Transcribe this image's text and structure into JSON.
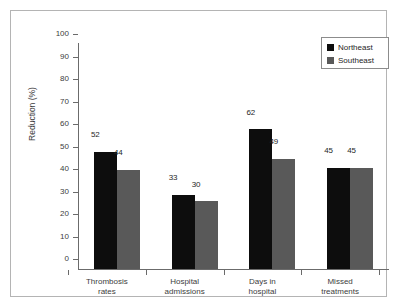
{
  "chart_data": {
    "type": "bar",
    "title": "",
    "xlabel": "",
    "ylabel": "Reduction (%)",
    "ylim": [
      0,
      100
    ],
    "ytick_step": 10,
    "yticks": [
      100,
      90,
      80,
      70,
      60,
      50,
      40,
      30,
      20,
      10,
      0
    ],
    "ytick_labels": [
      "100",
      "90",
      "80",
      "70",
      "60",
      "50",
      "40",
      "30",
      "20",
      "10",
      "0"
    ],
    "grid": false,
    "legend_position": "top-right",
    "categories": [
      "Thrombosis\nrates",
      "Hospital\nadmissions",
      "Days in\nhospital",
      "Missed\ntreatments"
    ],
    "series": [
      {
        "name": "Northeast",
        "color": "#0d0d0d",
        "values": [
          52,
          33,
          62,
          45
        ],
        "value_labels": [
          "52",
          "33",
          "62",
          "45"
        ]
      },
      {
        "name": "Southeast",
        "color": "#595959",
        "values": [
          44,
          30,
          49,
          45
        ],
        "value_labels": [
          "44",
          "30",
          "49",
          "45"
        ]
      }
    ]
  },
  "legend": {
    "entries": [
      {
        "label": "Northeast",
        "swatch": "legend-swatch-northeast"
      },
      {
        "label": "Southeast",
        "swatch": "legend-swatch-southeast"
      }
    ]
  },
  "axis": {
    "y_title": "Reduction (%)"
  }
}
